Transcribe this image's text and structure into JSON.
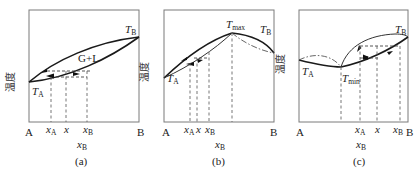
{
  "figure": {
    "y_axis_label": "温度",
    "x_axis_label_main": "x",
    "x_axis_label_sub": "B",
    "left_end": "A",
    "right_end": "B",
    "panels": [
      {
        "id": "a",
        "caption": "(a)",
        "region_label": "G+L",
        "point_labels": [
          {
            "main": "T",
            "sub": "A"
          },
          {
            "main": "T",
            "sub": "B"
          }
        ],
        "ticks": [
          {
            "main": "x",
            "sub": "A"
          },
          {
            "main": "x",
            "sub": ""
          },
          {
            "main": "x",
            "sub": "B"
          }
        ]
      },
      {
        "id": "b",
        "caption": "(b)",
        "point_labels": [
          {
            "main": "T",
            "sub": "A"
          },
          {
            "main": "T",
            "sub": "max"
          },
          {
            "main": "T",
            "sub": "B"
          }
        ],
        "ticks": [
          {
            "main": "x",
            "sub": "A"
          },
          {
            "main": "x",
            "sub": ""
          },
          {
            "main": "x",
            "sub": "B"
          }
        ]
      },
      {
        "id": "c",
        "caption": "(c)",
        "point_labels": [
          {
            "main": "T",
            "sub": "A"
          },
          {
            "main": "T",
            "sub": "min"
          },
          {
            "main": "T",
            "sub": "B"
          }
        ],
        "ticks": [
          {
            "main": "x",
            "sub": "A"
          },
          {
            "main": "x",
            "sub": ""
          },
          {
            "main": "x",
            "sub": "B"
          }
        ]
      }
    ]
  }
}
